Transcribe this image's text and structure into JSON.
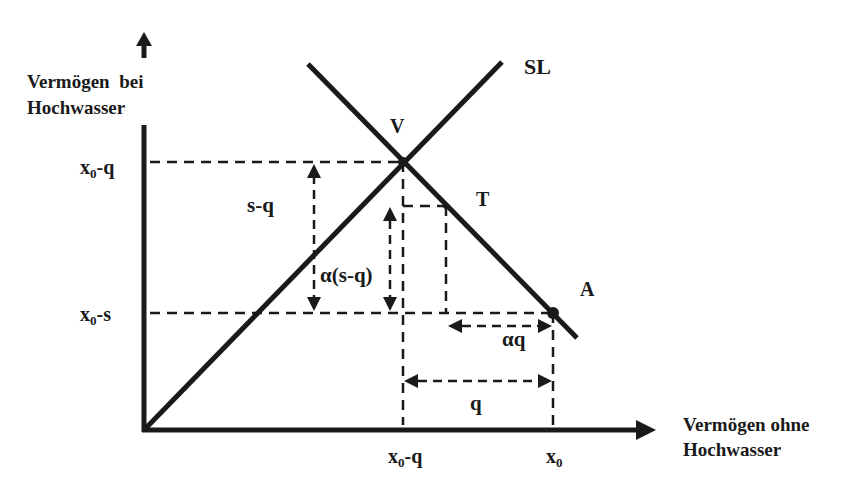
{
  "diagram": {
    "type": "economics-diagram",
    "y_axis": {
      "label_line1": "Vermögen  bei",
      "label_line2": "Hochwasser"
    },
    "x_axis": {
      "label_line1": "Vermögen ohne",
      "label_line2": "Hochwasser"
    },
    "lines": {
      "sl_label": "SL"
    },
    "points": {
      "v": "V",
      "t": "T",
      "a": "A"
    },
    "y_ticks": {
      "upper": {
        "base": "x",
        "sub": "0",
        "rest": "-q"
      },
      "lower": {
        "base": "x",
        "sub": "0",
        "rest": "-s"
      }
    },
    "x_ticks": {
      "left": {
        "base": "x",
        "sub": "0",
        "rest": "-q"
      },
      "right": {
        "base": "x",
        "sub": "0",
        "rest": ""
      }
    },
    "annotations": {
      "s_minus_q": "s-q",
      "alpha_s_minus_q": "α(s-q)",
      "alpha_q": "αq",
      "q": "q"
    },
    "colors": {
      "ink": "#1a1a1a",
      "background": "#ffffff"
    }
  }
}
